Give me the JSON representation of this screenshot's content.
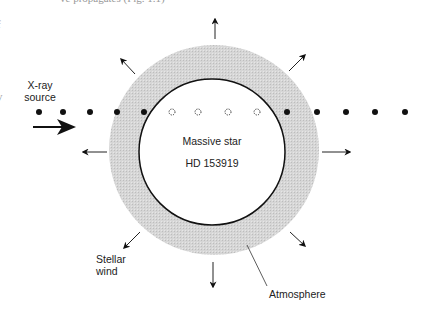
{
  "caption_fragment": "ve propagates (Fig. 1.1)",
  "edge_fragments": [
    "f",
    "y"
  ],
  "labels": {
    "xray_source_line1": "X-ray",
    "xray_source_line2": "source",
    "star_name": "Massive star",
    "star_id": "HD 153919",
    "wind_line1": "Stellar",
    "wind_line2": "wind",
    "atmosphere": "Atmosphere"
  },
  "colors": {
    "atmosphere_fill": "#d4d4d4",
    "star_fill": "#ffffff",
    "ink": "#111111"
  },
  "geometry": {
    "star_center": [
      213,
      152
    ],
    "atmosphere_radius": 105,
    "star_radius": 73,
    "dots_y": 112,
    "solid_dots_left_x": [
      39,
      63,
      90,
      117,
      144
    ],
    "hollow_dots_x": [
      172,
      198,
      228,
      257
    ],
    "solid_dots_right_x": [
      287,
      317,
      346,
      375,
      405
    ]
  },
  "wind_arrows": [
    {
      "direction": "up"
    },
    {
      "direction": "up-right"
    },
    {
      "direction": "right"
    },
    {
      "direction": "down-right"
    },
    {
      "direction": "down"
    },
    {
      "direction": "down-left"
    },
    {
      "direction": "left"
    },
    {
      "direction": "up-left"
    }
  ]
}
